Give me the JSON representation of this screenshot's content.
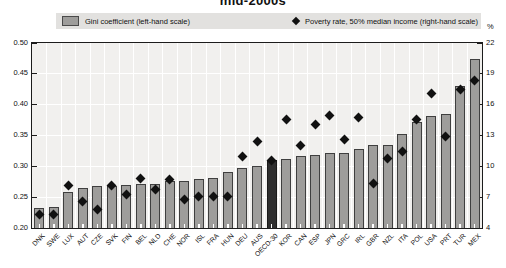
{
  "title": "mid-2000s",
  "legend": {
    "bar_label": "Gini coefficient (left-hand scale)",
    "diamond_label": "Poverty rate, 50% median income (right-hand scale)"
  },
  "colors": {
    "bar_fill": "#9e9d9b",
    "bar_border": "#3f3f3f",
    "highlight_bar_fill": "#2e2e2e",
    "highlight_bar_border": "#1a1a1a",
    "diamond": "#111111",
    "plot_bg": "#f1f0ee",
    "gridline": "#ffffff",
    "legend_bg": "#e2e1df",
    "frame": "#1c1c1c"
  },
  "chart_data": {
    "type": "bar",
    "title": "mid-2000s",
    "categories": [
      "DNK",
      "SWE",
      "LUX",
      "AUT",
      "CZE",
      "SVK",
      "FIN",
      "BEL",
      "NLD",
      "CHE",
      "NOR",
      "ISL",
      "FRA",
      "HUN",
      "DEU",
      "AUS",
      "OECD-30",
      "KOR",
      "CAN",
      "ESP",
      "JPN",
      "GRC",
      "IRL",
      "GBR",
      "NZL",
      "ITA",
      "POL",
      "USA",
      "PRT",
      "TUR",
      "MEX"
    ],
    "series": [
      {
        "name": "Gini coefficient (left-hand scale)",
        "type": "bar",
        "axis": "left",
        "values": [
          0.232,
          0.234,
          0.258,
          0.265,
          0.268,
          0.268,
          0.269,
          0.271,
          0.271,
          0.276,
          0.276,
          0.28,
          0.281,
          0.291,
          0.298,
          0.301,
          0.311,
          0.312,
          0.317,
          0.319,
          0.321,
          0.321,
          0.328,
          0.335,
          0.335,
          0.352,
          0.372,
          0.381,
          0.385,
          0.43,
          0.474
        ]
      },
      {
        "name": "Poverty rate, 50% median income (right-hand scale)",
        "type": "scatter",
        "axis": "right",
        "values": [
          5.3,
          5.3,
          8.1,
          6.6,
          5.8,
          8.1,
          7.3,
          8.8,
          7.7,
          8.7,
          6.8,
          7.1,
          7.1,
          7.1,
          11.0,
          12.4,
          10.6,
          14.6,
          12.0,
          14.1,
          14.9,
          12.6,
          14.8,
          8.3,
          10.8,
          11.4,
          14.6,
          17.1,
          12.9,
          17.5,
          18.4
        ]
      }
    ],
    "left_axis": {
      "min": 0.2,
      "max": 0.5,
      "tick_values": [
        0.5,
        0.45,
        0.4,
        0.35,
        0.3,
        0.25,
        0.2
      ],
      "tick_labels": [
        "0.50",
        "0.45",
        "0.40",
        "0.35",
        "0.30",
        "0.25",
        "0.20"
      ]
    },
    "right_axis": {
      "min": 4,
      "max": 22,
      "tick_values": [
        22,
        19,
        16,
        13,
        10,
        7,
        4
      ],
      "tick_labels": [
        "22",
        "19",
        "16",
        "13",
        "10",
        "7",
        "4"
      ],
      "unit": "%"
    },
    "highlight_category": "OECD-30",
    "grid": true,
    "legend_position": "top"
  }
}
